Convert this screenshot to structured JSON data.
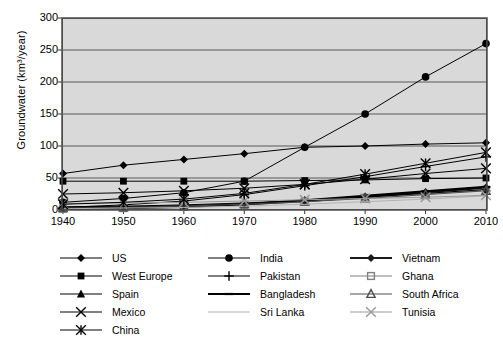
{
  "chart_data": {
    "type": "line",
    "title": "",
    "xlabel": "",
    "ylabel": "Groundwater (km3/year)",
    "ylabel_display": "Groundwater (km³/year)",
    "x": [
      1940,
      1950,
      1960,
      1970,
      1980,
      1990,
      2000,
      2010
    ],
    "xtick_labels": [
      "1940",
      "1950",
      "1960",
      "1970",
      "1980",
      "1990",
      "2000",
      "2010"
    ],
    "ytick_labels": [
      "0",
      "50",
      "100",
      "150",
      "200",
      "250",
      "300"
    ],
    "yticks": [
      0,
      50,
      100,
      150,
      200,
      250,
      300
    ],
    "ylim": [
      0,
      300
    ],
    "xlim": [
      1940,
      2010
    ],
    "grid": "horizontal",
    "legend_position": "below",
    "plot_background": "#d9d9d9",
    "series": [
      {
        "name": "US",
        "marker": "filled-diamond",
        "color": "#000000",
        "values": [
          57,
          70,
          79,
          88,
          98,
          100,
          103,
          105
        ]
      },
      {
        "name": "India",
        "marker": "filled-circle",
        "color": "#000000",
        "values": [
          12,
          18,
          27,
          45,
          98,
          150,
          208,
          260
        ]
      },
      {
        "name": "Vietnam",
        "marker": "filled-diamond",
        "color": "#1a1a1a",
        "values": [
          3,
          4,
          6,
          9,
          14,
          21,
          28,
          35
        ]
      },
      {
        "name": "West Europe",
        "marker": "filled-square",
        "color": "#000000",
        "values": [
          45,
          45,
          45,
          45,
          46,
          47,
          49,
          50
        ]
      },
      {
        "name": "Pakistan",
        "marker": "plus",
        "color": "#000000",
        "values": [
          4,
          8,
          14,
          24,
          38,
          52,
          68,
          83
        ]
      },
      {
        "name": "Ghana",
        "marker": "open-square",
        "color": "#808080",
        "values": [
          2,
          3,
          5,
          8,
          13,
          19,
          25,
          31
        ]
      },
      {
        "name": "Spain",
        "marker": "filled-triangle",
        "color": "#000000",
        "values": [
          5,
          6,
          8,
          11,
          15,
          20,
          26,
          32
        ]
      },
      {
        "name": "Bangladesh",
        "marker": "dash",
        "color": "#000000",
        "values": [
          2,
          3,
          5,
          9,
          15,
          22,
          29,
          36
        ]
      },
      {
        "name": "South Africa",
        "marker": "open-triangle",
        "color": "#4d4d4d",
        "values": [
          3,
          4,
          6,
          9,
          13,
          18,
          24,
          30
        ]
      },
      {
        "name": "Mexico",
        "marker": "cross-x",
        "color": "#000000",
        "values": [
          25,
          27,
          30,
          34,
          40,
          48,
          57,
          65
        ]
      },
      {
        "name": "Sri Lanka",
        "marker": "line",
        "color": "#b3b3b3",
        "values": [
          2,
          3,
          4,
          6,
          9,
          13,
          17,
          22
        ]
      },
      {
        "name": "Tunisia",
        "marker": "cross-x",
        "color": "#999999",
        "values": [
          10,
          11,
          12,
          14,
          16,
          18,
          20,
          23
        ]
      },
      {
        "name": "China",
        "marker": "asterisk",
        "color": "#000000",
        "values": [
          9,
          12,
          17,
          26,
          40,
          56,
          73,
          90
        ]
      }
    ],
    "legend_columns": [
      [
        "US",
        "West Europe",
        "Spain",
        "Mexico",
        "China"
      ],
      [
        "India",
        "Pakistan",
        "Bangladesh",
        "Sri Lanka"
      ],
      [
        "Vietnam",
        "Ghana",
        "South Africa",
        "Tunisia"
      ]
    ]
  }
}
